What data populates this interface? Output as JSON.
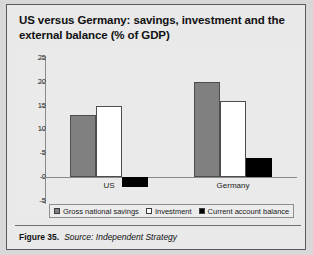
{
  "figure": {
    "title": "US versus Germany: savings, investment and the external balance (% of GDP)",
    "number_label": "Figure 35.",
    "source_label": "Source: Independent Strategy"
  },
  "colors": {
    "savings": "#808080",
    "investment": "#ffffff",
    "current_account": "#000000",
    "panel_background": "#eaeaea",
    "frame_background": "#e9e9e9",
    "axis": "#8a8a8a"
  },
  "chart_data": {
    "type": "bar",
    "title": "US versus Germany: savings, investment and the external balance (% of GDP)",
    "xlabel": "",
    "ylabel": "",
    "ylim": [
      -5,
      25
    ],
    "yticks": [
      25,
      20,
      15,
      10,
      5,
      0,
      -5
    ],
    "ytick_labels": [
      "25",
      "20",
      "15",
      "10",
      "5",
      "0",
      "-5"
    ],
    "grid": false,
    "legend_position": "bottom",
    "categories": [
      "US",
      "Germany"
    ],
    "series": [
      {
        "name": "Gross national savings",
        "values": [
          13,
          20
        ]
      },
      {
        "name": "Investment",
        "values": [
          15,
          16
        ]
      },
      {
        "name": "Current account balance",
        "values": [
          -2,
          4
        ]
      }
    ]
  }
}
